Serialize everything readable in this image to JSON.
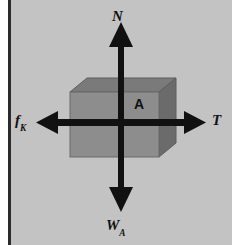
{
  "figure": {
    "type": "free-body-diagram",
    "background_color": "#c3c3c3",
    "margin_color": "#ffffff",
    "rule_color": "#2b2b2b",
    "arrow_color": "#111111"
  },
  "block": {
    "label": "A",
    "front_face_color": "#8d8d8d",
    "top_face_color": "#7a7a7a",
    "side_face_color": "#6b6b6b",
    "edge_color": "#5a5a5a"
  },
  "forces": [
    {
      "id": "normal",
      "symbol": "N",
      "subscript": "",
      "direction": "up",
      "description": "normal force"
    },
    {
      "id": "weight",
      "symbol": "W",
      "subscript": "A",
      "direction": "down",
      "description": "weight of block A"
    },
    {
      "id": "friction",
      "symbol": "f",
      "subscript": "K",
      "direction": "left",
      "description": "kinetic friction force"
    },
    {
      "id": "tension",
      "symbol": "T",
      "subscript": "",
      "direction": "right",
      "description": "tension force"
    }
  ]
}
